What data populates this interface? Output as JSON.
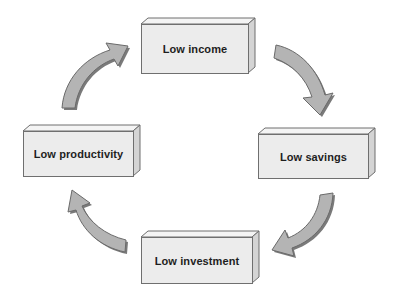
{
  "diagram": {
    "type": "cycle",
    "nodes": [
      {
        "id": "income",
        "label": "Low income"
      },
      {
        "id": "savings",
        "label": "Low savings"
      },
      {
        "id": "investment",
        "label": "Low investment"
      },
      {
        "id": "productivity",
        "label": "Low productivity"
      }
    ],
    "edges": [
      {
        "from": "income",
        "to": "savings"
      },
      {
        "from": "savings",
        "to": "investment"
      },
      {
        "from": "investment",
        "to": "productivity"
      },
      {
        "from": "productivity",
        "to": "income"
      }
    ],
    "colors": {
      "box_face": "#ececec",
      "box_top": "#f4f4f4",
      "box_side": "#d4d4d4",
      "box_border": "#6f6f6f",
      "arrow_fill": "#b4b4b4",
      "arrow_shadow": "#7a7a7a",
      "text": "#1e1e1e"
    }
  }
}
